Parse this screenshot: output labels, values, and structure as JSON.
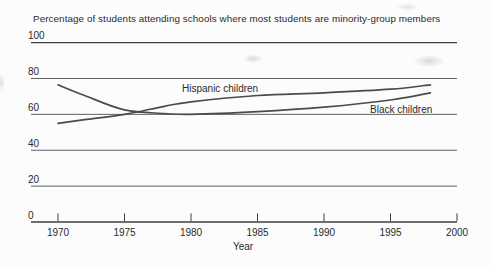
{
  "figure": {
    "title": "Percentage of students attending schools where most students are minority-group members"
  },
  "chart_data": {
    "type": "line",
    "title": "Percentage of students attending schools where most students are minority-group members",
    "xlabel": "Year",
    "ylabel": "",
    "x": [
      1970,
      1972,
      1975,
      1978,
      1980,
      1985,
      1990,
      1995,
      1998
    ],
    "series": [
      {
        "name": "Hispanic children",
        "values": [
          55,
          57,
          60,
          64.5,
          67,
          70.5,
          72,
          74,
          76.5
        ]
      },
      {
        "name": "Black children",
        "values": [
          76.5,
          70.5,
          62.5,
          60.5,
          60,
          61.5,
          64,
          68,
          72
        ]
      }
    ],
    "xticks": [
      1970,
      1975,
      1980,
      1985,
      1990,
      1995,
      2000
    ],
    "yticks": [
      0,
      20,
      40,
      60,
      80,
      100
    ],
    "xlim": [
      1970,
      2000
    ],
    "ylim": [
      0,
      100
    ],
    "grid": "horizontal-only",
    "legend": "inline-labels-on-lines",
    "line_color": "#4b4b4b",
    "grid_color": "#4f4f4f",
    "axis_color": "#3f3f3f",
    "text_color": "#2b2b2b",
    "background_color": "#fcfcfc"
  }
}
